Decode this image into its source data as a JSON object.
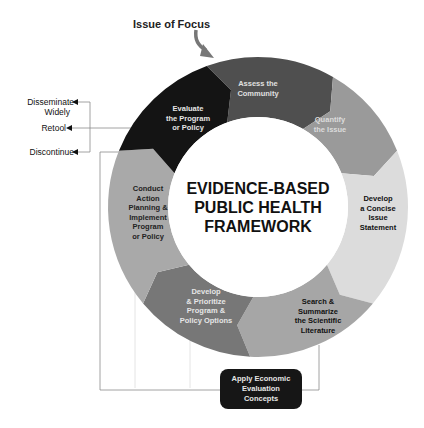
{
  "diagram": {
    "title_lines": [
      "EVIDENCE-BASED",
      "PUBLIC HEALTH",
      "FRAMEWORK"
    ],
    "entry_label": "Issue of Focus",
    "segments": [
      {
        "id": "assess",
        "lines": [
          "Assess the",
          "Community"
        ],
        "fill": "#4f4f4f",
        "text_color": "#e0e0e0"
      },
      {
        "id": "quantify",
        "lines": [
          "Quantify",
          "the Issue"
        ],
        "fill": "#9a9a9a",
        "text_color": "#dcdcdc"
      },
      {
        "id": "concise",
        "lines": [
          "Develop",
          "a Concise",
          "Issue",
          "Statement"
        ],
        "fill": "#dcdcdc",
        "text_color": "#111111"
      },
      {
        "id": "search",
        "lines": [
          "Search &",
          "Summarize",
          "the Scientific",
          "Literature"
        ],
        "fill": "#a6a6a6",
        "text_color": "#111111"
      },
      {
        "id": "prioritize",
        "lines": [
          "Develop",
          "& Prioritize",
          "Program &",
          "Policy Options"
        ],
        "fill": "#777777",
        "text_color": "#e6e6e6"
      },
      {
        "id": "conduct",
        "lines": [
          "Conduct",
          "Action",
          "Planning &",
          "Implement",
          "Program",
          "or Policy"
        ],
        "fill": "#a9a9a9",
        "text_color": "#222222"
      },
      {
        "id": "evaluate",
        "lines": [
          "Evaluate",
          "the Program",
          "or Policy"
        ],
        "fill": "#141414",
        "text_color": "#e6e6e6"
      }
    ],
    "outcomes": [
      {
        "id": "disseminate",
        "lines": [
          "Disseminate",
          "Widely"
        ]
      },
      {
        "id": "retool",
        "lines": [
          "Retool"
        ]
      },
      {
        "id": "discontinue",
        "lines": [
          "Discontinue"
        ]
      }
    ],
    "economic_box": {
      "lines": [
        "Apply Economic",
        "Evaluation",
        "Concepts"
      ]
    }
  }
}
